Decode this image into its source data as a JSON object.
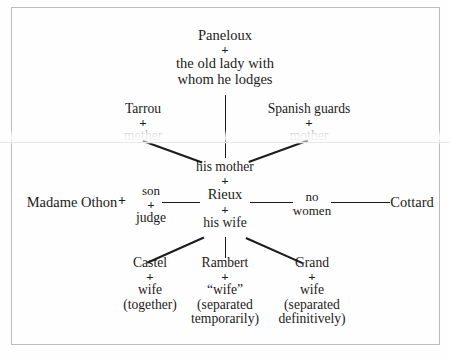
{
  "diagram": {
    "frame_color": "#b9bcc0",
    "ink_color": "#1b1b1b",
    "background_color": "#fefefe",
    "plus_symbol": "+",
    "nodes": {
      "paneloux": "Paneloux",
      "paneloux_partner_line1": "the old lady with",
      "paneloux_partner_line2": "whom he lodges",
      "tarrou": "Tarrou",
      "tarrou_partner": "mother",
      "spanish_guards": "Spanish guards",
      "spanish_guards_partner": "mother",
      "his_mother": "his mother",
      "rieux": "Rieux",
      "his_wife": "his wife",
      "madame_othon": "Madame Othon",
      "son": "son",
      "judge": "judge",
      "no_women_line1": "no",
      "no_women_line2": "women",
      "cottard": "Cottard",
      "castel": "Castel",
      "castel_partner": "wife",
      "castel_status": "(together)",
      "rambert": "Rambert",
      "rambert_partner": "“wife”",
      "rambert_status_line1": "(separated",
      "rambert_status_line2": "temporarily)",
      "grand": "Grand",
      "grand_partner": "wife",
      "grand_status_line1": "(separated",
      "grand_status_line2": "definitively)"
    }
  }
}
